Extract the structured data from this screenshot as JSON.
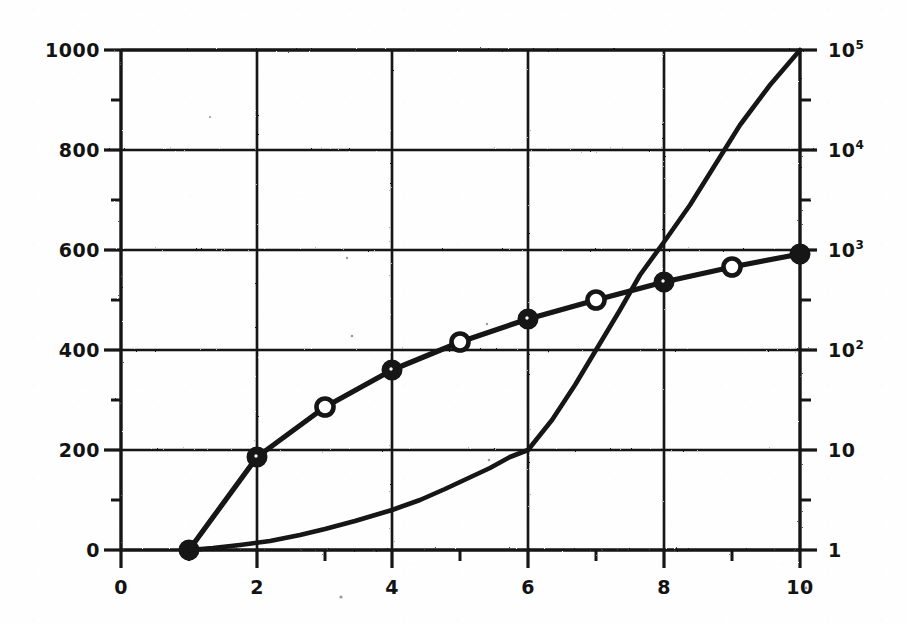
{
  "chart_data": {
    "type": "line",
    "title": "",
    "subtitle": "",
    "xlabel": "",
    "ylabel": "",
    "y2label": "",
    "grid": true,
    "legend": "none",
    "background_color": "#ffffff",
    "line_color": "#111111",
    "x": [
      1,
      2,
      3,
      4,
      5,
      6,
      7,
      8,
      9,
      10
    ],
    "xlim": [
      0,
      10
    ],
    "xticks": [
      0,
      2,
      4,
      6,
      8,
      10
    ],
    "xticklabels": [
      "0",
      "2",
      "4",
      "6",
      "8",
      "10"
    ],
    "xminorticks": [
      1,
      3,
      5,
      7,
      9
    ],
    "ylim": [
      0,
      1000
    ],
    "yticks": [
      0,
      200,
      400,
      600,
      800,
      1000
    ],
    "yticklabels": [
      "0",
      "200",
      "400",
      "600",
      "800",
      "1000"
    ],
    "yminorticks": [
      100,
      300,
      500,
      700,
      900
    ],
    "y2scale": "log",
    "y2lim": [
      1,
      100000
    ],
    "y2ticks": [
      1,
      10,
      100,
      1000,
      10000,
      100000
    ],
    "y2ticklabels": [
      "1",
      "10",
      "10^2",
      "10^3",
      "10^4",
      "10^5"
    ],
    "y2ticklabels_html": [
      "1",
      "10",
      "10<sup>2</sup>",
      "10<sup>3</sup>",
      "10<sup>4</sup>",
      "10<sup>5</sup>"
    ],
    "y2minorticks": [
      3.16,
      31.6,
      316,
      3160,
      31600
    ],
    "series": [
      {
        "name": "logarithmic-curve",
        "axis": "left",
        "marker": "circle",
        "marker_style_even": "filled",
        "marker_style_odd": "open",
        "x": [
          1,
          2,
          3,
          4,
          5,
          6,
          7,
          8,
          9,
          10
        ],
        "values": [
          0,
          185,
          285,
          360,
          415,
          462,
          500,
          535,
          565,
          592
        ]
      },
      {
        "name": "exponential-curve",
        "axis": "right",
        "marker": "none",
        "x": [
          1,
          2,
          3,
          4,
          5,
          6,
          7,
          8,
          9,
          10
        ],
        "values": [
          1,
          1.5,
          2.6,
          5.0,
          14,
          100,
          1000,
          6000,
          30000,
          100000
        ]
      }
    ]
  }
}
